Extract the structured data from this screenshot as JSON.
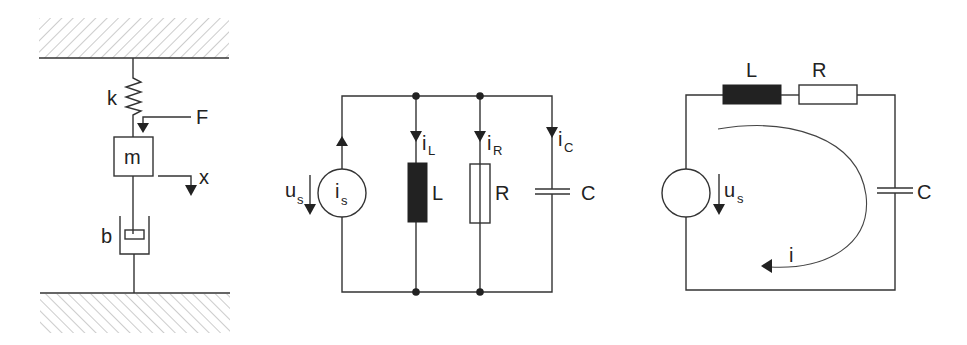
{
  "figure": {
    "panels": [
      {
        "id": "mechanical",
        "title": "Mass-spring-damper system",
        "labels": {
          "spring": "k",
          "force": "F",
          "mass": "m",
          "displacement": "x",
          "damper": "b"
        }
      },
      {
        "id": "parallel_rlc",
        "title": "Parallel RLC circuit with current source",
        "labels": {
          "source_voltage": "u",
          "source_voltage_sub": "s",
          "source_current": "i",
          "source_current_sub": "s",
          "inductor_current": "i",
          "inductor_current_sub": "L",
          "resistor_current": "i",
          "resistor_current_sub": "R",
          "capacitor_current": "i",
          "capacitor_current_sub": "C",
          "inductor": "L",
          "resistor": "R",
          "capacitor": "C"
        }
      },
      {
        "id": "series_rlc",
        "title": "Series RLC circuit with voltage source",
        "labels": {
          "inductor": "L",
          "resistor": "R",
          "capacitor": "C",
          "source_voltage": "u",
          "source_voltage_sub": "s",
          "loop_current": "i"
        }
      }
    ],
    "colors": {
      "line": "#333333",
      "inductor_fill": "#222222",
      "hatch": "#9a9a9a",
      "background": "#ffffff"
    }
  }
}
